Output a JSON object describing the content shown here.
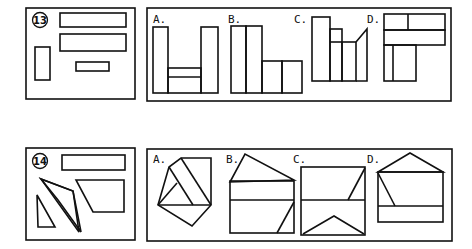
{
  "problems": [
    {
      "number": "13",
      "question_shapes": [
        "wide-rectangle",
        "wide-rectangle",
        "tall-small-rectangle",
        "small-flat-rectangle"
      ],
      "options": [
        {
          "label": "A."
        },
        {
          "label": "B."
        },
        {
          "label": "C."
        },
        {
          "label": "D."
        }
      ]
    },
    {
      "number": "14",
      "question_shapes": [
        "rectangle",
        "parallelogram",
        "triangle",
        "trapezoid"
      ],
      "options": [
        {
          "label": "A."
        },
        {
          "label": "B."
        },
        {
          "label": "C."
        },
        {
          "label": "D."
        }
      ]
    }
  ]
}
